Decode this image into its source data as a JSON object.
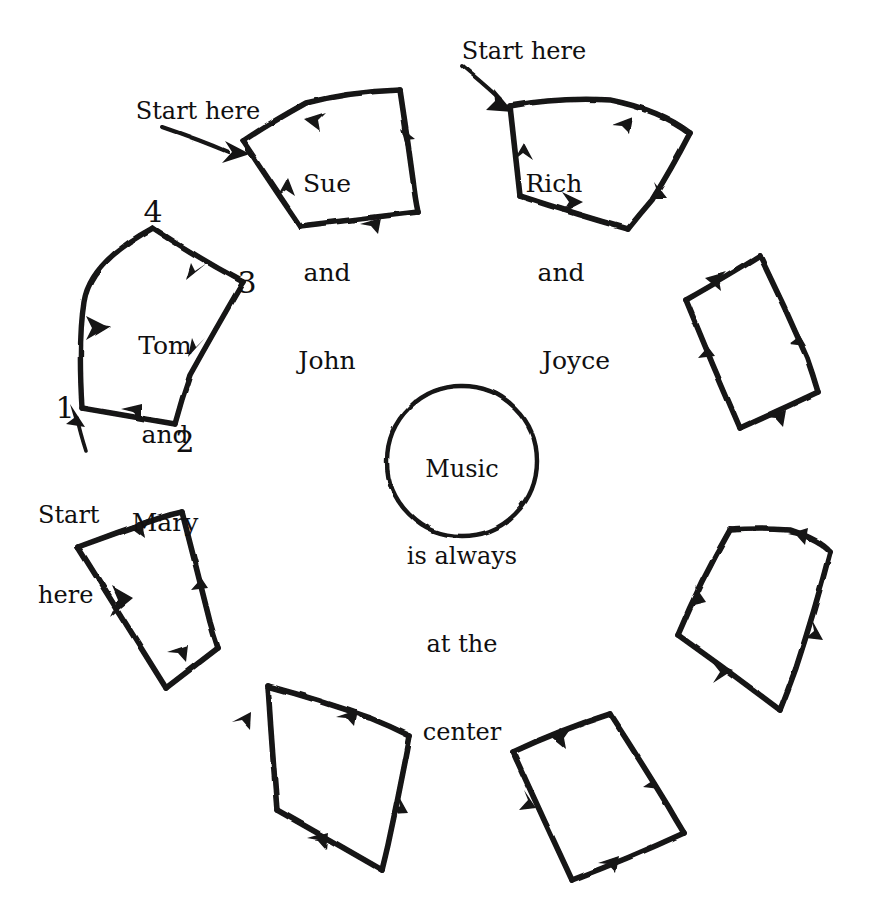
{
  "diagram": {
    "style": "hand-drawn",
    "stroke_color": "#141314",
    "background_color": "#ffffff",
    "center": {
      "shape": "circle",
      "lines": [
        "Music",
        "is always",
        "at the",
        "center"
      ],
      "text": "Music is always at the center"
    },
    "quads": [
      {
        "id": "quad-tom-mary",
        "position": "upper-left",
        "label_lines": [
          "Tom",
          "and",
          "Mary"
        ],
        "corner_numbers": [
          "1",
          "2",
          "3",
          "4"
        ],
        "start_here": true
      },
      {
        "id": "quad-sue-john",
        "position": "top-left",
        "label_lines": [
          "Sue",
          "and",
          "John"
        ],
        "corner_numbers": [],
        "start_here": true
      },
      {
        "id": "quad-rich-joyce",
        "position": "top-right",
        "label_lines": [
          "Rich",
          "and",
          "Joyce"
        ],
        "corner_numbers": [],
        "start_here": true
      },
      {
        "id": "quad-right-upper",
        "position": "upper-right",
        "label_lines": [],
        "corner_numbers": [],
        "start_here": false
      },
      {
        "id": "quad-right-lower",
        "position": "lower-right",
        "label_lines": [],
        "corner_numbers": [],
        "start_here": false
      },
      {
        "id": "quad-bottom-right",
        "position": "bottom-right",
        "label_lines": [],
        "corner_numbers": [],
        "start_here": false
      },
      {
        "id": "quad-bottom-left",
        "position": "bottom-left",
        "label_lines": [],
        "corner_numbers": [],
        "start_here": false
      },
      {
        "id": "quad-left-lower",
        "position": "lower-left",
        "label_lines": [],
        "corner_numbers": [],
        "start_here": false
      }
    ],
    "annotations": {
      "start_here": "Start here",
      "start_here_line1": "Start",
      "start_here_line2": "here"
    },
    "corner_labels": {
      "one": "1",
      "two": "2",
      "three": "3",
      "four": "4"
    },
    "couples": {
      "tom_mary_line1": "Tom",
      "tom_mary_line2": "and",
      "tom_mary_line3": "Mary",
      "sue_john_line1": "Sue",
      "sue_john_line2": "and",
      "sue_john_line3": "John",
      "rich_joyce_line1": "Rich",
      "rich_joyce_line2": "and",
      "rich_joyce_line3": "Joyce"
    },
    "center_text": {
      "line1": "Music",
      "line2": "is always",
      "line3": "at the",
      "line4": "center"
    }
  }
}
